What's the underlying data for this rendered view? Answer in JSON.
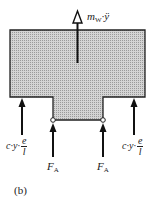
{
  "figure": {
    "caption": "(b)",
    "body_fill": "#c8c8c8",
    "outline_color": "#222222",
    "labels": {
      "inertia_force": {
        "main": "m",
        "sub": "W",
        "rest": "·ÿ"
      },
      "spring_left": {
        "prefix": "c·y·",
        "num": "e",
        "den": "l"
      },
      "spring_right": {
        "prefix": "c·y·",
        "num": "e",
        "den": "l"
      },
      "support_left": {
        "main": "F",
        "sub": "A"
      },
      "support_right": {
        "main": "F",
        "sub": "A"
      }
    }
  }
}
